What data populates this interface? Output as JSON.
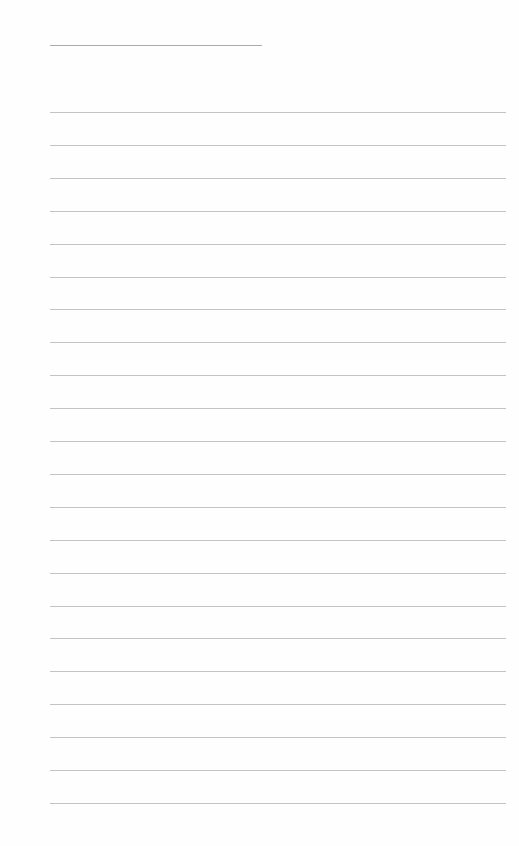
{
  "document": {
    "type": "lined-paper",
    "title_line": {
      "label": "",
      "x": 50,
      "y": 45,
      "width": 212
    },
    "ruled_lines": {
      "count": 22,
      "first_y": 112,
      "spacing": 32.9,
      "x": 50,
      "width": 456
    },
    "colors": {
      "paper": "#fefefe",
      "rule": "#b9b9b9",
      "title_rule": "#9c9c9c"
    }
  }
}
